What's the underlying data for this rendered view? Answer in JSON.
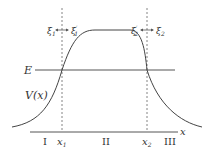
{
  "diagram": {
    "energy_label": "E",
    "potential_label": "V(x)",
    "axis_label": "x",
    "turning_points": [
      "x1",
      "x2"
    ],
    "turning_point_labels": {
      "x1_main": "x",
      "x1_sub": "1",
      "x2_main": "x",
      "x2_sub": "2"
    },
    "regions": [
      "I",
      "II",
      "III"
    ],
    "xi_labels": {
      "xi1_main": "ξ",
      "xi1_sub": "1",
      "xi1p_main": "ξ",
      "xi1p_sup": "′",
      "xi1p_sub": "1",
      "xi2p_main": "ξ",
      "xi2p_sup": "′",
      "xi2p_sub": "2",
      "xi2_main": "ξ",
      "xi2_sub": "2"
    },
    "colors": {
      "stroke": "#444444",
      "line": "#555555",
      "dashed": "#666666"
    }
  }
}
